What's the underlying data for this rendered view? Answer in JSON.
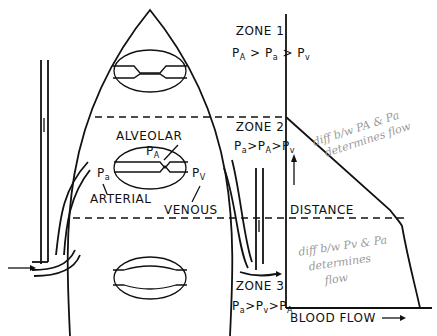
{
  "diagram": {
    "zones": [
      {
        "label": "ZONE 1",
        "relation": [
          "P",
          "A",
          " > ",
          "P",
          "a",
          " > ",
          "P",
          "v"
        ]
      },
      {
        "label": "ZONE 2",
        "relation": [
          "P",
          "a",
          ">",
          "P",
          "A",
          ">",
          "P",
          "v"
        ]
      },
      {
        "label": "ZONE 3",
        "relation": [
          "P",
          "a",
          ">",
          "P",
          "v",
          ">",
          "P",
          "A"
        ]
      }
    ],
    "alveolus_labels": {
      "alveolar": "ALVEOLAR",
      "pa_alveolar_base": "P",
      "pa_alveolar_sub": "A",
      "arterial_p_base": "P",
      "arterial_p_sub": "a",
      "venous_p_base": "P",
      "venous_p_sub": "V",
      "arterial": "ARTERIAL",
      "venous": "VENOUS"
    },
    "graph": {
      "y_axis_label": "DISTANCE",
      "x_axis_label": "BLOOD FLOW",
      "arrow": "→"
    },
    "handwritten_notes": [
      {
        "lines": [
          "diff b/w PA & Pa",
          "determines flow"
        ]
      },
      {
        "lines": [
          "diff b/w Pv & Pa",
          "determines",
          "flow"
        ]
      }
    ],
    "colors": {
      "ink": "#111111",
      "pencil": "#9a9a9a",
      "background": "#ffffff"
    }
  }
}
